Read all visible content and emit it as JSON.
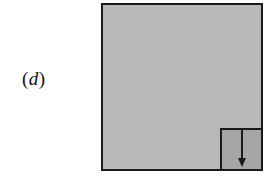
{
  "figure": {
    "label_open": "(",
    "label_var": "d",
    "label_close": ")",
    "outer_fill": "#b9b9b9",
    "inner_fill": "#a6a6a6",
    "stroke_color": "#1a1a1a",
    "arrow_direction": "down"
  }
}
